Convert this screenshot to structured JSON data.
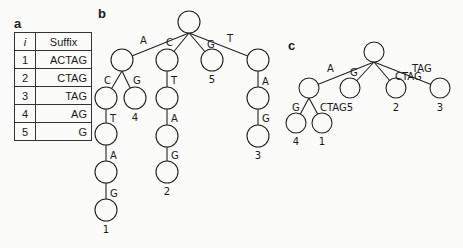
{
  "panels": {
    "a": {
      "label": "a",
      "table": {
        "headers": {
          "index": "i",
          "suffix": "Suffix"
        },
        "rows": [
          {
            "i": "1",
            "suffix": "ACTAG"
          },
          {
            "i": "2",
            "suffix": "CTAG"
          },
          {
            "i": "3",
            "suffix": "TAG"
          },
          {
            "i": "4",
            "suffix": "AG"
          },
          {
            "i": "5",
            "suffix": "G"
          }
        ]
      }
    },
    "b": {
      "label": "b",
      "type": "suffix-trie",
      "edges": {
        "root_A": "A",
        "root_C": "C",
        "root_G": "G",
        "root_T": "T",
        "A_C": "C",
        "A_G": "G",
        "AC_T": "T",
        "ACT_A": "A",
        "ACTA_G": "G",
        "C_T": "T",
        "CT_A": "A",
        "CTA_G": "G",
        "T_A": "A",
        "TA_G": "G"
      },
      "leaves": {
        "ACTAG": "1",
        "CTAG": "2",
        "TAG": "3",
        "AG": "4",
        "G": "5"
      }
    },
    "c": {
      "label": "c",
      "type": "suffix-tree",
      "edges": {
        "root_A": "A",
        "root_G": "G",
        "root_CTAG": "CTAG",
        "root_TAG": "TAG",
        "A_G": "G",
        "A_CTAG": "CTAG"
      },
      "leaves": {
        "AG": "4",
        "ACTAG": "1",
        "G": "5",
        "CTAG": "2",
        "TAG": "3"
      }
    }
  }
}
